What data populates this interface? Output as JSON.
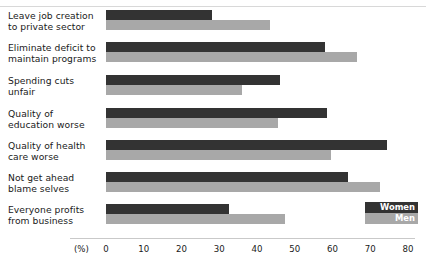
{
  "chart_data": {
    "type": "bar",
    "orientation": "horizontal",
    "title": "",
    "xlabel": "(%)",
    "ylabel": "",
    "xlim": [
      0,
      80
    ],
    "xticks": [
      0,
      10,
      20,
      30,
      40,
      50,
      60,
      70,
      80
    ],
    "grid": false,
    "legend_position": "bottom-right",
    "categories": [
      "Leave job creation to private sector",
      "Eliminate deficit to maintain programs",
      "Spending cuts unfair",
      "Quality of education worse",
      "Quality of health care worse",
      "Not get ahead blame selves",
      "Everyone profits from business"
    ],
    "category_lines": [
      [
        "Leave job creation",
        "to private sector"
      ],
      [
        "Eliminate deficit to",
        "maintain programs"
      ],
      [
        "Spending cuts",
        "unfair"
      ],
      [
        "Quality of",
        "education worse"
      ],
      [
        "Quality of health",
        "care worse"
      ],
      [
        "Not get ahead",
        "blame selves"
      ],
      [
        "Everyone profits",
        "from business"
      ]
    ],
    "series": [
      {
        "name": "Women",
        "color": "#333333",
        "values": [
          28,
          58,
          46,
          58.5,
          74.5,
          64,
          32.5
        ]
      },
      {
        "name": "Men",
        "color": "#a8a8a8",
        "values": [
          43.5,
          66.5,
          36,
          45.5,
          59.5,
          72.5,
          47.5
        ]
      }
    ]
  },
  "axis": {
    "unit_label": "(%)",
    "tick_labels": [
      "0",
      "10",
      "20",
      "30",
      "40",
      "50",
      "60",
      "70",
      "80"
    ]
  },
  "legend": {
    "women_label": "Women",
    "men_label": "Men"
  }
}
